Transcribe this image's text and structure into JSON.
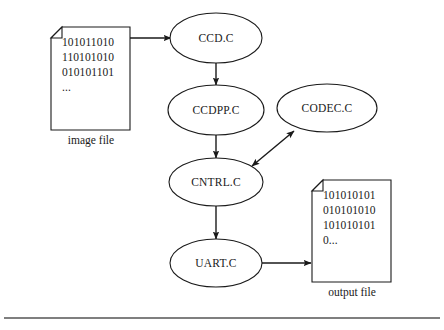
{
  "diagram": {
    "type": "flow-diagram",
    "background_color": "#ffffff",
    "stroke_color": "#1a1a1a",
    "nodes": [
      {
        "id": "ccd",
        "label": "CCD.C",
        "shape": "ellipse",
        "cx": 216,
        "cy": 38,
        "rx": 46,
        "ry": 25
      },
      {
        "id": "ccdpp",
        "label": "CCDPP.C",
        "shape": "ellipse",
        "cx": 216,
        "cy": 110,
        "rx": 48,
        "ry": 25
      },
      {
        "id": "codec",
        "label": "CODEC.C",
        "shape": "ellipse",
        "cx": 327,
        "cy": 108,
        "rx": 50,
        "ry": 24
      },
      {
        "id": "cntrl",
        "label": "CNTRL.C",
        "shape": "ellipse",
        "cx": 216,
        "cy": 182,
        "rx": 47,
        "ry": 24
      },
      {
        "id": "uart",
        "label": "UART.C",
        "shape": "ellipse",
        "cx": 216,
        "cy": 263,
        "rx": 46,
        "ry": 24
      }
    ],
    "documents": [
      {
        "id": "image-file",
        "caption": "image file",
        "lines": [
          "101011010",
          "110101010",
          "010101101",
          "..."
        ],
        "x": 51,
        "y": 27,
        "width": 79,
        "height": 103,
        "caption_x": 91,
        "caption_y": 144
      },
      {
        "id": "output-file",
        "caption": "output file",
        "lines": [
          "101010101",
          "010101010",
          "101010101",
          "0..."
        ],
        "x": 312,
        "y": 180,
        "width": 79,
        "height": 102,
        "caption_x": 352,
        "caption_y": 296
      }
    ],
    "edges": [
      {
        "id": "image-to-ccd",
        "from": "image-file",
        "to": "ccd",
        "direction": "forward"
      },
      {
        "id": "ccd-to-ccdpp",
        "from": "ccd",
        "to": "ccdpp",
        "direction": "forward"
      },
      {
        "id": "ccdpp-to-cntrl",
        "from": "ccdpp",
        "to": "cntrl",
        "direction": "forward"
      },
      {
        "id": "cntrl-codec",
        "from": "cntrl",
        "to": "codec",
        "direction": "bidirectional"
      },
      {
        "id": "cntrl-to-uart",
        "from": "cntrl",
        "to": "uart",
        "direction": "forward"
      },
      {
        "id": "uart-to-output",
        "from": "uart",
        "to": "output-file",
        "direction": "forward"
      }
    ],
    "footer_rule": {
      "x1": 4,
      "y1": 318,
      "x2": 440,
      "y2": 318
    }
  }
}
